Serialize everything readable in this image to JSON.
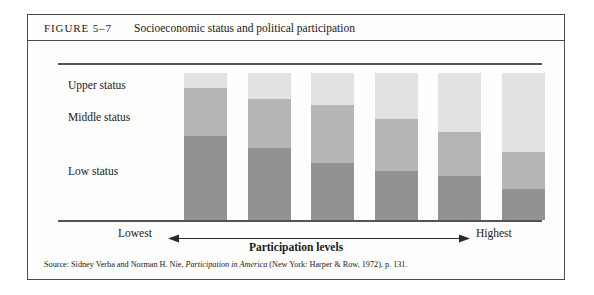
{
  "figure": {
    "label": "FIGURE 5–7",
    "title": "Socioeconomic status and political participation",
    "source": {
      "prefix": "Source: Sidney Verba and Norman H. Nie, ",
      "italic_title": "Participation in America",
      "suffix": " (New York: Harper & Row, 1972), p. 131."
    }
  },
  "axis": {
    "low_end_label": "Lowest",
    "high_end_label": "Highest",
    "xlabel": "Participation levels",
    "arrow_icon": "double-headed-arrow-icon"
  },
  "colors": {
    "upper_status": "#e2e2e0",
    "middle_status": "#b5b5b3",
    "low_status": "#929291",
    "rule": "#55534f",
    "frame": "#4a4a4a"
  },
  "chart_data": {
    "type": "bar",
    "title": "Socioeconomic status and political participation",
    "subtitle": "",
    "xlabel": "Participation levels",
    "ylabel": "",
    "stacked": true,
    "normalized_percent": true,
    "grid": false,
    "legend_position": "left-inline",
    "ylim": [
      0,
      100
    ],
    "categories": [
      "Lowest",
      "2nd lowest",
      "3rd",
      "4th",
      "5th",
      "Highest"
    ],
    "category_axis_endpoints": [
      "Lowest",
      "Highest"
    ],
    "series": [
      {
        "name": "Upper status",
        "color": "#e2e2e0",
        "values": [
          10,
          18,
          22,
          31,
          40,
          54
        ]
      },
      {
        "name": "Middle status",
        "color": "#b5b5b3",
        "values": [
          33,
          33,
          39,
          36,
          30,
          25
        ]
      },
      {
        "name": "Low status",
        "color": "#929291",
        "values": [
          57,
          49,
          39,
          33,
          30,
          21
        ]
      }
    ],
    "annotations": [
      "Upper status",
      "Middle status",
      "Low status"
    ],
    "source": "Source: Sidney Verba and Norman H. Nie, Participation in America (New York: Harper & Row, 1972), p. 131."
  }
}
